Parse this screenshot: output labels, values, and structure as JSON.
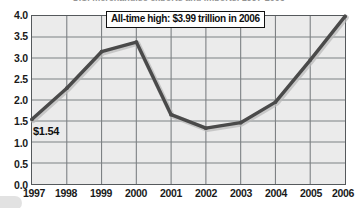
{
  "chart_data": {
    "type": "line",
    "title": "U.S. merchandise exports and imports, 1997-2006",
    "subtitle": "",
    "xlabel": "",
    "ylabel": "",
    "categories": [
      "1997",
      "1998",
      "1999",
      "2000",
      "2001",
      "2002",
      "2003",
      "2004",
      "2005",
      "2006"
    ],
    "x": [
      1997,
      1998,
      1999,
      2000,
      2001,
      2002,
      2003,
      2004,
      2005,
      2006
    ],
    "values": [
      1.54,
      2.28,
      3.15,
      3.38,
      1.65,
      1.33,
      1.46,
      1.95,
      2.95,
      3.99
    ],
    "series": [
      {
        "name": "Value (trillions of dollars)",
        "values": [
          1.54,
          2.28,
          3.15,
          3.38,
          1.65,
          1.33,
          1.46,
          1.95,
          2.95,
          3.99
        ],
        "color": "#4a4a4a"
      }
    ],
    "ylim": [
      0.0,
      4.0
    ],
    "ytick_step": 0.5,
    "ytick_labels": [
      "0.0",
      "0.5",
      "1.0",
      "1.5",
      "2.0",
      "2.5",
      "3.0",
      "3.5",
      "4.0"
    ],
    "ytick_values": [
      0.0,
      0.5,
      1.0,
      1.5,
      2.0,
      2.5,
      3.0,
      3.5,
      4.0
    ],
    "xtick_labels": [
      "1997",
      "1998",
      "1999",
      "2000",
      "2001",
      "2002",
      "2003",
      "2004",
      "2005",
      "2006"
    ],
    "grid": true,
    "grid_horizontal": true,
    "grid_vertical": true,
    "legend": false,
    "legend_position": "none",
    "annotations": [
      {
        "id": "all-time-high-callout",
        "text": "All-time high: $3.99 trillion in 2006",
        "target_x": "2006",
        "target_y": 3.99
      },
      {
        "id": "first-point-value",
        "text": "$1.54",
        "target_x": "1997",
        "target_y": 1.54
      }
    ]
  },
  "colors": {
    "plot_background": "#ebebeb",
    "page_background": "#ffffff",
    "line": "#4a4a4a",
    "gridline": "#7d8184",
    "axis_border": "#55595c",
    "text": "#1a1a1a",
    "callout_border": "#111111",
    "callout_background": "#ffffff"
  }
}
